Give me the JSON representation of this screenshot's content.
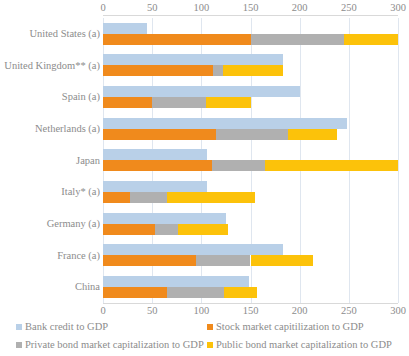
{
  "chart_data": {
    "type": "bar",
    "orientation": "horizontal",
    "stacked": true,
    "title": "",
    "xlabel": "",
    "ylabel": "",
    "xlim": [
      0,
      300
    ],
    "xticks": [
      0,
      50,
      100,
      150,
      200,
      250,
      300
    ],
    "xtick_labels": [
      "0",
      "50",
      "100",
      "150",
      "200",
      "250",
      "300"
    ],
    "grid": true,
    "axis_position": "both-top-and-bottom",
    "legend_position": "bottom",
    "categories": [
      "United States (a)",
      "United Kingdom** (a)",
      "Spain (a)",
      "Netherlands (a)",
      "Japan",
      "Italy* (a)",
      "Germany (a)",
      "France (a)",
      "China"
    ],
    "series": [
      {
        "name": "Bank credit to GDP",
        "color": "#b9d0e8",
        "values": [
          45,
          183,
          200,
          248,
          106,
          106,
          125,
          183,
          148
        ]
      },
      {
        "name": "Stock market capitilization to GDP",
        "color": "#f08a1c",
        "values": [
          150,
          112,
          50,
          115,
          111,
          27,
          53,
          95,
          65
        ]
      },
      {
        "name": "Private bond market capitalization to GDP",
        "color": "#b0b0b0",
        "values": [
          95,
          10,
          55,
          73,
          54,
          38,
          23,
          55,
          58
        ]
      },
      {
        "name": "Public bond market capitalization to GDP",
        "color": "#fcc20a",
        "values": [
          55,
          61,
          45,
          50,
          135,
          90,
          51,
          64,
          34
        ]
      }
    ],
    "stacked_totals": [
      300,
      183,
      150,
      238,
      300,
      155,
      127,
      214,
      157
    ]
  },
  "legend": {
    "items": [
      {
        "label": "Bank credit to GDP",
        "color": "#b9d0e8"
      },
      {
        "label": "Stock market capitilization to GDP",
        "color": "#f08a1c"
      },
      {
        "label": "Private bond market capitalization to GDP",
        "color": "#b0b0b0"
      },
      {
        "label": "Public bond market capitalization to GDP",
        "color": "#fcc20a"
      }
    ]
  }
}
